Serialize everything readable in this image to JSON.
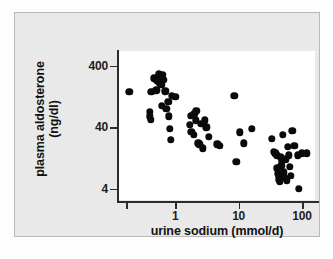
{
  "figure": {
    "background_color": "#e9e9e9",
    "plot_background_color": "#ffffff",
    "point_color": "#0a0a0a",
    "axis_color": "#2b2b2b"
  },
  "chart_data": {
    "type": "scatter",
    "title": "",
    "subtitle": "",
    "xlabel": "urine sodium (mmol/d)",
    "ylabel_line1": "plasma aldosterone",
    "ylabel_line2": "(ng/dl)",
    "ylabel": "plasma aldosterone (ng/dl)",
    "xscale": "log",
    "yscale": "log",
    "xlim": [
      0.13,
      160
    ],
    "ylim": [
      2.6,
      700
    ],
    "xticks": [
      1,
      10,
      100
    ],
    "xtick_labels": [
      "1",
      "10",
      "100"
    ],
    "yticks": [
      4,
      40,
      400
    ],
    "ytick_labels": [
      "4",
      "40",
      "400"
    ],
    "grid": false,
    "legend": null,
    "annotations": [],
    "n_points": 70,
    "series": [
      {
        "name": "patients",
        "marker": "filled-circle",
        "color": "#0a0a0a",
        "points": [
          [
            0.19,
            150
          ],
          [
            0.42,
            150
          ],
          [
            0.4,
            72
          ],
          [
            0.4,
            60
          ],
          [
            0.41,
            53
          ],
          [
            0.47,
            250
          ],
          [
            0.5,
            160
          ],
          [
            0.52,
            230
          ],
          [
            0.55,
            300
          ],
          [
            0.56,
            215
          ],
          [
            0.58,
            265
          ],
          [
            0.6,
            240
          ],
          [
            0.6,
            195
          ],
          [
            0.62,
            90
          ],
          [
            0.63,
            285
          ],
          [
            0.66,
            240
          ],
          [
            0.7,
            155
          ],
          [
            0.72,
            80
          ],
          [
            0.78,
            105
          ],
          [
            0.8,
            60
          ],
          [
            0.82,
            38
          ],
          [
            0.86,
            25
          ],
          [
            0.88,
            130
          ],
          [
            1.0,
            125
          ],
          [
            1.7,
            44
          ],
          [
            1.75,
            62
          ],
          [
            1.8,
            34
          ],
          [
            1.95,
            30
          ],
          [
            2.0,
            66
          ],
          [
            2.1,
            52
          ],
          [
            2.15,
            74
          ],
          [
            2.3,
            22
          ],
          [
            2.4,
            21
          ],
          [
            2.55,
            45
          ],
          [
            2.7,
            18
          ],
          [
            2.9,
            52
          ],
          [
            3.1,
            40
          ],
          [
            3.4,
            28
          ],
          [
            4.6,
            21
          ],
          [
            5.0,
            20
          ],
          [
            8.6,
            130
          ],
          [
            9.2,
            11
          ],
          [
            10.5,
            33
          ],
          [
            12.0,
            22
          ],
          [
            16.0,
            38
          ],
          [
            33.0,
            26
          ],
          [
            36.0,
            16
          ],
          [
            38.0,
            15
          ],
          [
            40.0,
            14
          ],
          [
            41.0,
            8.5
          ],
          [
            42.0,
            7.0
          ],
          [
            43.0,
            6.2
          ],
          [
            44.0,
            5.6
          ],
          [
            45.0,
            5.2
          ],
          [
            46.0,
            13
          ],
          [
            47.0,
            9.5
          ],
          [
            48.0,
            11
          ],
          [
            50.0,
            30
          ],
          [
            52.0,
            7.4
          ],
          [
            54.0,
            6.0
          ],
          [
            56.0,
            12
          ],
          [
            58.0,
            5.4
          ],
          [
            60.0,
            19
          ],
          [
            62.0,
            14
          ],
          [
            64.0,
            9.0
          ],
          [
            66.0,
            6.4
          ],
          [
            70.0,
            35
          ],
          [
            75.0,
            20
          ],
          [
            85.0,
            14
          ],
          [
            88.0,
            4.0
          ],
          [
            100.0,
            15
          ],
          [
            120.0,
            15
          ]
        ]
      }
    ]
  }
}
